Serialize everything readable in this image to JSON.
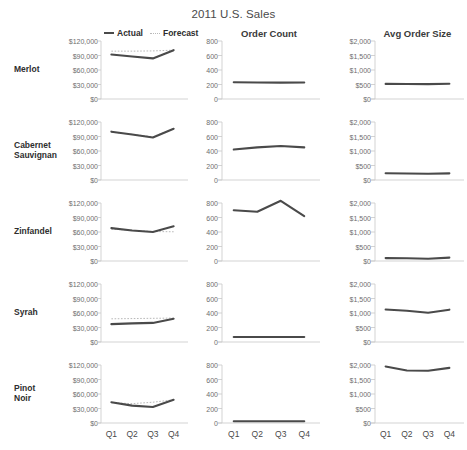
{
  "title": "2011 U.S. Sales",
  "legend": {
    "items": [
      {
        "label": "Actual",
        "style": "solid",
        "color": "#4a4a4a"
      },
      {
        "label": "Forecast",
        "style": "dotted",
        "color": "#b9b9b9"
      }
    ]
  },
  "columns": [
    {
      "key": "sales",
      "title": "",
      "header_visible": false
    },
    {
      "key": "order_count",
      "title": "Order Count",
      "header_visible": true
    },
    {
      "key": "avg_order_size",
      "title": "Avg Order Size",
      "header_visible": true
    }
  ],
  "rows": [
    {
      "key": "merlot",
      "label": "Merlot"
    },
    {
      "key": "cabernet",
      "label": "Cabernet\nSauvignan"
    },
    {
      "key": "zinfandel",
      "label": "Zinfandel"
    },
    {
      "key": "syrah",
      "label": "Syrah"
    },
    {
      "key": "pinot_noir",
      "label": "Pinot\nNoir"
    }
  ],
  "axes": {
    "x_categories": [
      "Q1",
      "Q2",
      "Q3",
      "Q4"
    ],
    "sales": {
      "ticks": [
        0,
        30000,
        60000,
        90000,
        120000
      ],
      "tick_labels": [
        "$0",
        "$30,000",
        "$60,000",
        "$90,000",
        "$120,000"
      ],
      "min": 0,
      "max": 120000
    },
    "order_count": {
      "ticks": [
        0,
        200,
        400,
        600,
        800
      ],
      "tick_labels": [
        "0",
        "200",
        "400",
        "600",
        "800"
      ],
      "min": 0,
      "max": 800
    },
    "avg_order_size": {
      "ticks": [
        0,
        500,
        1000,
        1500,
        2000
      ],
      "tick_labels": [
        "$0",
        "$500",
        "$1,000",
        "$1,500",
        "$2,000"
      ],
      "min": 0,
      "max": 2000
    }
  },
  "chart_data": {
    "type": "line",
    "title": "2011 U.S. Sales",
    "subtitle": "",
    "xlabel": "",
    "ylabel": "",
    "layout": "small-multiples 5 rows x 3 columns",
    "grid": false,
    "legend_position": "top-left above first column",
    "x": [
      "Q1",
      "Q2",
      "Q3",
      "Q4"
    ],
    "panels": [
      {
        "row": "Merlot",
        "column": "Sales",
        "ylabel": "Sales",
        "ylim": [
          0,
          120000
        ],
        "series": [
          {
            "name": "Actual",
            "values": [
              92000,
              88000,
              84000,
              101000
            ]
          },
          {
            "name": "Forecast",
            "values": [
              99000,
              99000,
              99500,
              101000
            ]
          }
        ]
      },
      {
        "row": "Merlot",
        "column": "Order Count",
        "ylabel": "Order Count",
        "ylim": [
          0,
          800
        ],
        "series": [
          {
            "name": "Actual",
            "values": [
              230,
              228,
              226,
              228
            ]
          }
        ]
      },
      {
        "row": "Merlot",
        "column": "Avg Order Size",
        "ylabel": "Avg Order Size",
        "ylim": [
          0,
          2000
        ],
        "series": [
          {
            "name": "Actual",
            "values": [
              520,
              515,
              512,
              525
            ]
          }
        ]
      },
      {
        "row": "Cabernet Sauvignan",
        "column": "Sales",
        "ylabel": "Sales",
        "ylim": [
          0,
          120000
        ],
        "series": [
          {
            "name": "Actual",
            "values": [
              100000,
              94000,
              88000,
              106000
            ]
          },
          {
            "name": "Forecast",
            "values": [
              99000,
              94500,
              89500,
              106000
            ]
          }
        ]
      },
      {
        "row": "Cabernet Sauvignan",
        "column": "Order Count",
        "ylabel": "Order Count",
        "ylim": [
          0,
          800
        ],
        "series": [
          {
            "name": "Actual",
            "values": [
              420,
              450,
              470,
              450
            ]
          }
        ]
      },
      {
        "row": "Cabernet Sauvignan",
        "column": "Avg Order Size",
        "ylabel": "Avg Order Size",
        "ylim": [
          0,
          2000
        ],
        "series": [
          {
            "name": "Actual",
            "values": [
              235,
              225,
              215,
              230
            ]
          }
        ]
      },
      {
        "row": "Zinfandel",
        "column": "Sales",
        "ylabel": "Sales",
        "ylim": [
          0,
          120000
        ],
        "series": [
          {
            "name": "Actual",
            "values": [
              68000,
              63000,
              60000,
              72000
            ]
          },
          {
            "name": "Forecast",
            "values": [
              66000,
              63500,
              61000,
              60500
            ]
          }
        ]
      },
      {
        "row": "Zinfandel",
        "column": "Order Count",
        "ylabel": "Order Count",
        "ylim": [
          0,
          800
        ],
        "series": [
          {
            "name": "Actual",
            "values": [
              700,
              680,
              830,
              620
            ]
          }
        ]
      },
      {
        "row": "Zinfandel",
        "column": "Avg Order Size",
        "ylabel": "Avg Order Size",
        "ylim": [
          0,
          2000
        ],
        "series": [
          {
            "name": "Actual",
            "values": [
              100,
              95,
              78,
              115
            ]
          }
        ]
      },
      {
        "row": "Syrah",
        "column": "Sales",
        "ylabel": "Sales",
        "ylim": [
          0,
          120000
        ],
        "series": [
          {
            "name": "Actual",
            "values": [
              37000,
              38500,
              39500,
              48000
            ]
          },
          {
            "name": "Forecast",
            "values": [
              48000,
              48500,
              49000,
              49500
            ]
          }
        ]
      },
      {
        "row": "Syrah",
        "column": "Order Count",
        "ylabel": "Order Count",
        "ylim": [
          0,
          800
        ],
        "series": [
          {
            "name": "Actual",
            "values": [
              70,
              70,
              70,
              70
            ]
          }
        ]
      },
      {
        "row": "Syrah",
        "column": "Avg Order Size",
        "ylabel": "Avg Order Size",
        "ylim": [
          0,
          2000
        ],
        "series": [
          {
            "name": "Actual",
            "values": [
              1120,
              1075,
              1010,
              1115
            ]
          }
        ]
      },
      {
        "row": "Pinot Noir",
        "column": "Sales",
        "ylabel": "Sales",
        "ylim": [
          0,
          120000
        ],
        "series": [
          {
            "name": "Actual",
            "values": [
              43000,
              36000,
              33000,
              48000
            ]
          },
          {
            "name": "Forecast",
            "values": [
              42000,
              40000,
              43000,
              48000
            ]
          }
        ]
      },
      {
        "row": "Pinot Noir",
        "column": "Order Count",
        "ylabel": "Order Count",
        "ylim": [
          0,
          800
        ],
        "series": [
          {
            "name": "Actual",
            "values": [
              25,
              24,
              24,
              25
            ]
          }
        ]
      },
      {
        "row": "Pinot Noir",
        "column": "Avg Order Size",
        "ylabel": "Avg Order Size",
        "ylim": [
          0,
          2000
        ],
        "series": [
          {
            "name": "Actual",
            "values": [
              1950,
              1810,
              1800,
              1900
            ]
          }
        ]
      }
    ]
  },
  "colors": {
    "actual": "#4a4a4a",
    "forecast": "#b9b9b9",
    "axis": "#c8c8c8",
    "text": "#4a4a4a",
    "background": "#ffffff"
  }
}
